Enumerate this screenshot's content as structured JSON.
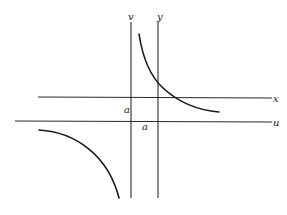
{
  "diagram": {
    "type": "coordinate-translation-hyperbola",
    "axes": [
      {
        "id": "v",
        "label": "v",
        "orientation": "vertical"
      },
      {
        "id": "y",
        "label": "y",
        "orientation": "vertical"
      },
      {
        "id": "x",
        "label": "x",
        "orientation": "horizontal"
      },
      {
        "id": "u",
        "label": "u",
        "orientation": "horizontal"
      }
    ],
    "offsets": [
      {
        "label": "a",
        "between": "x and u axes"
      },
      {
        "label": "a",
        "between": "v and y axes"
      }
    ],
    "curves": [
      {
        "name": "upper-right-branch"
      },
      {
        "name": "lower-left-branch"
      }
    ]
  },
  "labels": {
    "v": "v",
    "y": "y",
    "x": "x",
    "u": "u",
    "a_vertical": "a",
    "a_horizontal": "a"
  }
}
